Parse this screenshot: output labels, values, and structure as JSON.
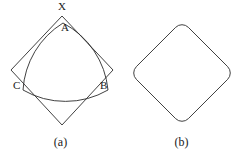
{
  "figure": {
    "background_color": "#ffffff",
    "stroke_color": "#2b2b2b",
    "panels": [
      {
        "id": "a",
        "caption": "(a)",
        "description": "Reuleaux triangle inscribed in a square rotated 45 degrees",
        "labels": [
          {
            "name": "X",
            "text": "X",
            "role": "square-corner"
          },
          {
            "name": "A",
            "text": "A",
            "role": "reuleaux-vertex"
          },
          {
            "name": "B",
            "text": "B",
            "role": "reuleaux-vertex"
          },
          {
            "name": "C",
            "text": "C",
            "role": "reuleaux-vertex"
          }
        ],
        "shapes": {
          "square": {
            "type": "polygon",
            "points": "62,16 113,70 62,125 11,70"
          },
          "reuleaux": {
            "type": "curved-triangle",
            "vertices": {
              "A": [
                63,
                23
              ],
              "B": [
                108,
                90
              ],
              "C": [
                23,
                90
              ]
            },
            "arcs": [
              {
                "from": "C",
                "to": "A",
                "bulge": "outward"
              },
              {
                "from": "A",
                "to": "B",
                "bulge": "outward"
              },
              {
                "from": "B",
                "to": "C",
                "bulge": "outward"
              }
            ]
          }
        }
      },
      {
        "id": "b",
        "caption": "(b)",
        "description": "Rounded-corner square traced by the rotating Reuleaux triangle",
        "labels": [],
        "shapes": {
          "rounded_diamond": {
            "type": "rounded-polygon",
            "points": "61,21 113,73 61,125 9,73",
            "corner_radius": 9
          }
        }
      }
    ]
  }
}
